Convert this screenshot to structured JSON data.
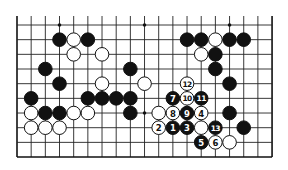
{
  "diagram": {
    "type": "go-board-partial",
    "columns": 19,
    "rows_shown": 10,
    "board_edges": [
      "left",
      "right",
      "bottom"
    ],
    "open_edge": "top",
    "star_points": [
      [
        3,
        0
      ],
      [
        9,
        0
      ],
      [
        15,
        0
      ],
      [
        3,
        6
      ],
      [
        9,
        6
      ],
      [
        15,
        6
      ]
    ],
    "stones": [
      {
        "col": 3,
        "row": 1,
        "color": "black"
      },
      {
        "col": 4,
        "row": 1,
        "color": "white"
      },
      {
        "col": 5,
        "row": 1,
        "color": "black"
      },
      {
        "col": 12,
        "row": 1,
        "color": "black"
      },
      {
        "col": 13,
        "row": 1,
        "color": "black"
      },
      {
        "col": 14,
        "row": 1,
        "color": "white"
      },
      {
        "col": 15,
        "row": 1,
        "color": "black"
      },
      {
        "col": 16,
        "row": 1,
        "color": "black"
      },
      {
        "col": 4,
        "row": 2,
        "color": "white"
      },
      {
        "col": 6,
        "row": 2,
        "color": "white"
      },
      {
        "col": 13,
        "row": 2,
        "color": "white"
      },
      {
        "col": 14,
        "row": 2,
        "color": "black"
      },
      {
        "col": 2,
        "row": 3,
        "color": "black"
      },
      {
        "col": 8,
        "row": 3,
        "color": "black"
      },
      {
        "col": 14,
        "row": 3,
        "color": "black"
      },
      {
        "col": 3,
        "row": 4,
        "color": "black"
      },
      {
        "col": 6,
        "row": 4,
        "color": "white"
      },
      {
        "col": 9,
        "row": 4,
        "color": "white"
      },
      {
        "col": 12,
        "row": 4,
        "color": "white",
        "label": "12"
      },
      {
        "col": 15,
        "row": 4,
        "color": "black"
      },
      {
        "col": 1,
        "row": 5,
        "color": "black"
      },
      {
        "col": 5,
        "row": 5,
        "color": "black"
      },
      {
        "col": 6,
        "row": 5,
        "color": "black"
      },
      {
        "col": 7,
        "row": 5,
        "color": "black"
      },
      {
        "col": 8,
        "row": 5,
        "color": "black"
      },
      {
        "col": 11,
        "row": 5,
        "color": "black",
        "label": "7"
      },
      {
        "col": 12,
        "row": 5,
        "color": "white",
        "label": "10"
      },
      {
        "col": 13,
        "row": 5,
        "color": "black",
        "label": "11"
      },
      {
        "col": 1,
        "row": 6,
        "color": "white"
      },
      {
        "col": 2,
        "row": 6,
        "color": "black"
      },
      {
        "col": 3,
        "row": 6,
        "color": "black"
      },
      {
        "col": 4,
        "row": 6,
        "color": "white"
      },
      {
        "col": 5,
        "row": 6,
        "color": "white"
      },
      {
        "col": 8,
        "row": 6,
        "color": "black"
      },
      {
        "col": 10,
        "row": 6,
        "color": "white"
      },
      {
        "col": 11,
        "row": 6,
        "color": "white",
        "label": "8"
      },
      {
        "col": 12,
        "row": 6,
        "color": "black",
        "label": "9"
      },
      {
        "col": 13,
        "row": 6,
        "color": "white",
        "label": "4"
      },
      {
        "col": 15,
        "row": 6,
        "color": "black"
      },
      {
        "col": 1,
        "row": 7,
        "color": "white"
      },
      {
        "col": 2,
        "row": 7,
        "color": "white"
      },
      {
        "col": 3,
        "row": 7,
        "color": "white"
      },
      {
        "col": 10,
        "row": 7,
        "color": "white",
        "label": "2"
      },
      {
        "col": 11,
        "row": 7,
        "color": "black",
        "label": "1"
      },
      {
        "col": 12,
        "row": 7,
        "color": "black",
        "label": "3"
      },
      {
        "col": 13,
        "row": 7,
        "color": "white"
      },
      {
        "col": 14,
        "row": 7,
        "color": "black",
        "label": "13"
      },
      {
        "col": 16,
        "row": 7,
        "color": "black"
      },
      {
        "col": 13,
        "row": 8,
        "color": "black",
        "label": "5"
      },
      {
        "col": 14,
        "row": 8,
        "color": "white",
        "label": "6"
      },
      {
        "col": 15,
        "row": 8,
        "color": "white"
      }
    ]
  },
  "layout_px": {
    "x0": 17,
    "dx": 14.17,
    "y0": 25,
    "dy": 14.67,
    "top_extension": 9,
    "stone_radius": 6.8
  }
}
